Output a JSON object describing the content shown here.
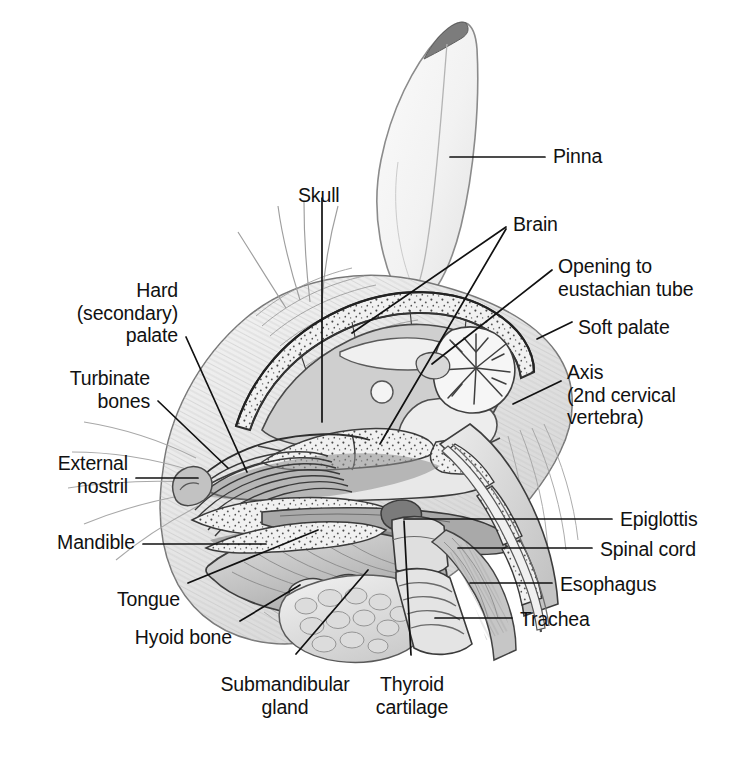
{
  "figure": {
    "background_color": "#ffffff",
    "ink_color": "#111111",
    "label_font_size_px": 19.5
  },
  "labels": {
    "pinna": "Pinna",
    "skull": "Skull",
    "brain": "Brain",
    "opening_to_eustachian_tube": "Opening to\neustachian tube",
    "soft_palate": "Soft palate",
    "axis": "Axis\n(2nd cervical\nvertebra)",
    "hard_secondary_palate": "Hard\n(secondary)\npalate",
    "turbinate_bones": "Turbinate\nbones",
    "external_nostril": "External\nnostril",
    "mandible": "Mandible",
    "tongue": "Tongue",
    "hyoid_bone": "Hyoid bone",
    "submandibular_gland": "Submandibular\ngland",
    "thyroid_cartilage": "Thyroid\ncartilage",
    "epiglottis": "Epiglottis",
    "spinal_cord": "Spinal cord",
    "esophagus": "Esophagus",
    "trachea": "Trachea"
  },
  "label_positions": {
    "pinna": {
      "x": 553,
      "y": 145,
      "align": "left"
    },
    "skull": {
      "x": 298,
      "y": 184,
      "align": "left"
    },
    "brain": {
      "x": 513,
      "y": 213,
      "align": "left"
    },
    "opening_to_eustachian_tube": {
      "x": 558,
      "y": 255,
      "align": "left"
    },
    "soft_palate": {
      "x": 578,
      "y": 316,
      "align": "left"
    },
    "axis": {
      "x": 567,
      "y": 361,
      "align": "left"
    },
    "hard_secondary_palate": {
      "x": 178,
      "y": 279,
      "align": "right"
    },
    "turbinate_bones": {
      "x": 150,
      "y": 367,
      "align": "right"
    },
    "external_nostril": {
      "x": 128,
      "y": 452,
      "align": "right"
    },
    "mandible": {
      "x": 135,
      "y": 531,
      "align": "right"
    },
    "tongue": {
      "x": 180,
      "y": 588,
      "align": "right"
    },
    "hyoid_bone": {
      "x": 232,
      "y": 626,
      "align": "right"
    },
    "submandibular_gland": {
      "x": 285,
      "y": 673,
      "align": "center"
    },
    "thyroid_cartilage": {
      "x": 412,
      "y": 673,
      "align": "center"
    },
    "epiglottis": {
      "x": 620,
      "y": 508,
      "align": "left"
    },
    "spinal_cord": {
      "x": 600,
      "y": 538,
      "align": "left"
    },
    "esophagus": {
      "x": 560,
      "y": 573,
      "align": "left"
    },
    "trachea": {
      "x": 520,
      "y": 608,
      "align": "left"
    }
  },
  "leader_lines": [
    {
      "name": "pinna-leader",
      "points": "450,157 545,157"
    },
    {
      "name": "skull-leader",
      "points": "322,198 322,422"
    },
    {
      "name": "brain-leader-a",
      "points": "506,227 352,333"
    },
    {
      "name": "brain-leader-b",
      "points": "506,229 380,444"
    },
    {
      "name": "eustachian-tube-leader",
      "points": "552,270 432,364"
    },
    {
      "name": "soft-palate-leader",
      "points": "572,322 537,339"
    },
    {
      "name": "axis-leader",
      "points": "561,381 513,404"
    },
    {
      "name": "hard-palate-leader",
      "points": "186,337 247,472"
    },
    {
      "name": "turbinate-bones-leader",
      "points": "158,401 228,468"
    },
    {
      "name": "external-nostril-leader",
      "points": "136,478 198,478"
    },
    {
      "name": "mandible-leader",
      "points": "143,544 266,544"
    },
    {
      "name": "tongue-leader",
      "points": "188,583 318,530"
    },
    {
      "name": "hyoid-bone-leader",
      "points": "240,621 300,585"
    },
    {
      "name": "submandibular-gland-leader",
      "points": "296,654 368,570"
    },
    {
      "name": "thyroid-cartilage-leader",
      "points": "411,655 404,521"
    },
    {
      "name": "epiglottis-leader",
      "points": "612,519 404,519"
    },
    {
      "name": "spinal-cord-leader",
      "points": "592,548 458,548"
    },
    {
      "name": "esophagus-leader",
      "points": "552,583 470,583"
    },
    {
      "name": "trachea-leader",
      "points": "512,618 435,618"
    }
  ]
}
